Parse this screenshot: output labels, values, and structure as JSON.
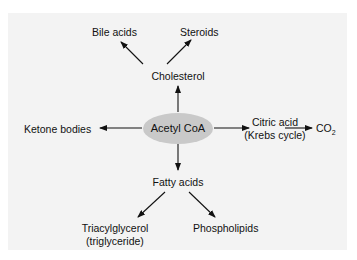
{
  "diagram": {
    "center": "Acetyl CoA",
    "nodes": {
      "bile_acids": "Bile acids",
      "steroids": "Steroids",
      "cholesterol": "Cholesterol",
      "ketone_bodies": "Ketone bodies",
      "citric_acid": "Citric acid",
      "krebs_cycle": "(Krebs cycle)",
      "co2": "CO",
      "co2_sub": "2",
      "fatty_acids": "Fatty acids",
      "triacylglycerol": "Triacylglycerol",
      "triglyceride": "(triglyceride)",
      "phospholipids": "Phospholipids"
    },
    "edges": [
      [
        "Acetyl CoA",
        "Cholesterol"
      ],
      [
        "Cholesterol",
        "Bile acids"
      ],
      [
        "Cholesterol",
        "Steroids"
      ],
      [
        "Acetyl CoA",
        "Ketone bodies"
      ],
      [
        "Acetyl CoA",
        "Citric acid (Krebs cycle)"
      ],
      [
        "Citric acid (Krebs cycle)",
        "CO2"
      ],
      [
        "Acetyl CoA",
        "Fatty acids"
      ],
      [
        "Fatty acids",
        "Triacylglycerol (triglyceride)"
      ],
      [
        "Fatty acids",
        "Phospholipids"
      ]
    ],
    "colors": {
      "panel": "#f3f3f3",
      "ellipse": "#c9c9c9",
      "ink": "#111111"
    }
  }
}
